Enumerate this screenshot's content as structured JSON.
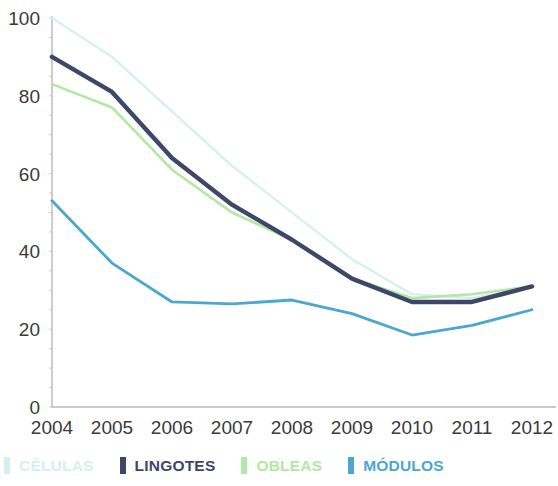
{
  "chart_data": {
    "type": "line",
    "title": "",
    "subtitle": "",
    "xlabel": "",
    "ylabel": "",
    "categories": [
      "2004",
      "2005",
      "2006",
      "2007",
      "2008",
      "2009",
      "2010",
      "2011",
      "2012"
    ],
    "x": [
      2004,
      2005,
      2006,
      2007,
      2008,
      2009,
      2010,
      2011,
      2012
    ],
    "xlim": [
      2004,
      2012
    ],
    "ylim": [
      0,
      100
    ],
    "yticks": [
      0,
      20,
      40,
      60,
      80,
      100
    ],
    "ytick_labels": [
      "0",
      "20",
      "40",
      "60",
      "80",
      "100"
    ],
    "grid": false,
    "legend_position": "bottom",
    "series": [
      {
        "name": "CÉLULAS",
        "color": "#d3f0f0",
        "values": [
          100,
          90,
          76,
          62,
          50,
          38,
          29,
          28,
          31
        ]
      },
      {
        "name": "LINGOTES",
        "color": "#3f4769",
        "values": [
          90,
          81,
          64,
          52,
          43,
          33,
          27,
          27,
          31
        ]
      },
      {
        "name": "OBLEAS",
        "color": "#b3e7a4",
        "values": [
          83,
          77,
          61,
          50,
          43,
          33,
          28,
          29,
          31
        ]
      },
      {
        "name": "MÓDULOS",
        "color": "#4aa8cf",
        "values": [
          53,
          37,
          27,
          26.5,
          27.5,
          24,
          18.5,
          21,
          25
        ]
      }
    ]
  },
  "legend": {
    "items": [
      {
        "label": "CÉLULAS",
        "color": "#d3f0f0"
      },
      {
        "label": "LINGOTES",
        "color": "#3f4769"
      },
      {
        "label": "OBLEAS",
        "color": "#b3e7a4"
      },
      {
        "label": "MÓDULOS",
        "color": "#4aa8cf"
      }
    ]
  }
}
